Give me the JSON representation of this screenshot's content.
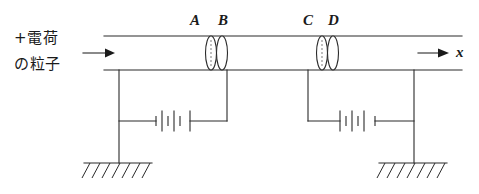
{
  "figure": {
    "background_color": "#ffffff",
    "line_color": "#2a2a2a",
    "text_color": "#1a1a1a"
  },
  "annotations": {
    "particle_label_line1": "+電荷",
    "particle_label_line2": "の粒子",
    "axis_label": "x"
  },
  "electrodes": [
    {
      "id": "A",
      "label": "A"
    },
    {
      "id": "B",
      "label": "B"
    },
    {
      "id": "C",
      "label": "C"
    },
    {
      "id": "D",
      "label": "D"
    }
  ],
  "circuit": {
    "battery_left": {
      "cells": 3,
      "name": "battery-left"
    },
    "battery_right": {
      "cells": 3,
      "name": "battery-right"
    },
    "ground_left": {
      "name": "ground-left",
      "hatch_count": 7
    },
    "ground_right": {
      "name": "ground-right",
      "hatch_count": 7
    }
  },
  "arrows": {
    "incoming_particle": "right",
    "axis_direction": "right"
  }
}
